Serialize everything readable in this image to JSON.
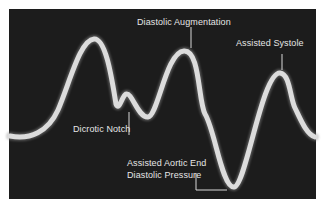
{
  "figure": {
    "background": "#1c1c1c",
    "trace_color": "#dcdcdc",
    "label_color": "#e6e6e6"
  },
  "labels": {
    "diastolic_augmentation": "Diastolic Augmentation",
    "assisted_systole": "Assisted Systole",
    "dicrotic_notch": "Dicrotic Notch",
    "assisted_aortic_end_line1": "Assisted Aortic End",
    "assisted_aortic_end_line2": "Diastolic Pressure"
  }
}
